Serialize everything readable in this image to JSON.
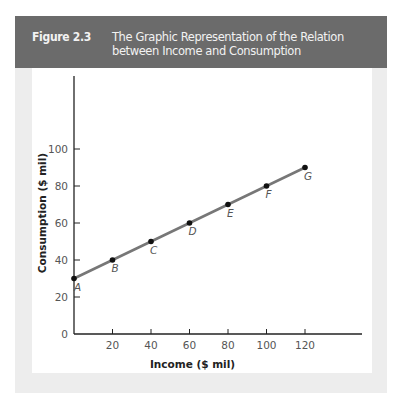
{
  "figure": {
    "number": "Figure 2.3",
    "title": "The Graphic Representation of the Relation between Income and Consumption"
  },
  "colors": {
    "header_bg": "#6b6b6b",
    "line": "#777777",
    "panel": "#ededed"
  },
  "chart_data": {
    "type": "line",
    "title": "The Graphic Representation of the Relation between Income and Consumption",
    "xlabel": "Income ($ mil)",
    "ylabel": "Consumption ($ mil)",
    "x": [
      0,
      20,
      40,
      60,
      80,
      100,
      120
    ],
    "series": [
      {
        "name": "Consumption",
        "values": [
          30,
          40,
          50,
          60,
          70,
          80,
          90
        ]
      }
    ],
    "point_labels": [
      "A",
      "B",
      "C",
      "D",
      "E",
      "F",
      "G"
    ],
    "x_ticks": [
      "20",
      "40",
      "60",
      "80",
      "100",
      "120"
    ],
    "y_ticks": [
      "0",
      "20",
      "40",
      "60",
      "80",
      "100"
    ],
    "xlim": [
      0,
      140
    ],
    "ylim": [
      0,
      120
    ],
    "grid": false,
    "legend": "none"
  }
}
